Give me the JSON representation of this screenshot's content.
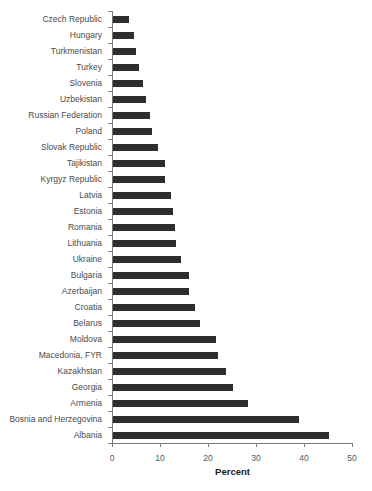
{
  "chart_data": {
    "type": "bar",
    "orientation": "horizontal",
    "xlabel": "Percent",
    "xlim": [
      0,
      50
    ],
    "xticks": [
      0,
      10,
      20,
      30,
      40,
      50
    ],
    "grid": false,
    "legend": false,
    "bar_color": "#2e2e2e",
    "axis_color": "#7a7a7a",
    "label_color": "#4a4a4a",
    "categories": [
      "Czech Republic",
      "Hungary",
      "Turkmenistan",
      "Turkey",
      "Slovenia",
      "Uzbekistan",
      "Russian Federation",
      "Poland",
      "Slovak Republic",
      "Tajikistan",
      "Kyrgyz Republic",
      "Latvia",
      "Estonia",
      "Romania",
      "Lithuania",
      "Ukraine",
      "Bulgaria",
      "Azerbaijan",
      "Croatia",
      "Belarus",
      "Moldova",
      "Macedonia, FYR",
      "Kazakhstan",
      "Georgia",
      "Armenia",
      "Bosnia and Herzegovina",
      "Albania"
    ],
    "values": [
      3.4,
      4.3,
      4.8,
      5.4,
      6.3,
      6.8,
      7.6,
      8.1,
      9.4,
      10.9,
      10.9,
      12.0,
      12.4,
      12.9,
      13.1,
      14.2,
      15.9,
      15.9,
      17.0,
      18.2,
      21.5,
      21.8,
      23.5,
      25.0,
      28.1,
      38.8,
      45.0
    ]
  }
}
